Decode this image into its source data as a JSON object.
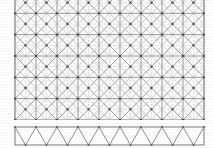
{
  "figure": {
    "type": "engineering-line-drawing",
    "background_color": "#ffffff",
    "canvas": {
      "width": 213,
      "height": 148
    }
  },
  "main_panel": {
    "name": "cross-braced-grid-panel",
    "x": 15,
    "y": -8,
    "width": 189,
    "height": 128,
    "columns": 9,
    "rows": 6,
    "cell_width": 21,
    "cell_height": 21,
    "clipped_at_top": true,
    "frame_color": "#6f6f6f",
    "frame_stroke_width": 1.1,
    "chord_color": "#8a8a8a",
    "chord_stroke_width": 0.9,
    "diagonal_color": "#9a9a9a",
    "diagonal_stroke_width": 1.0,
    "inner_diamond_color": "#b4b4b4",
    "inner_diamond_stroke_width": 0.7,
    "centerline_color": "#a8a8a8",
    "centerline_dash": "1.2 1.6",
    "node_color": "#4a4a4a",
    "node_radius": 1.15
  },
  "bottom_panel": {
    "name": "warren-truss-strip",
    "x": 15,
    "y": 127,
    "width": 189,
    "height": 18,
    "bays": 9,
    "frame_color": "#7a7a7a",
    "frame_stroke_width": 1.0,
    "web_color": "#8d8d8d",
    "web_stroke_width": 1.0,
    "node_color": "#5a5a5a",
    "node_radius": 1.0,
    "gap_above": 7
  },
  "render_hints": {
    "scan_artifact": true,
    "grid_on": true,
    "legend": "none",
    "labels": "none"
  }
}
